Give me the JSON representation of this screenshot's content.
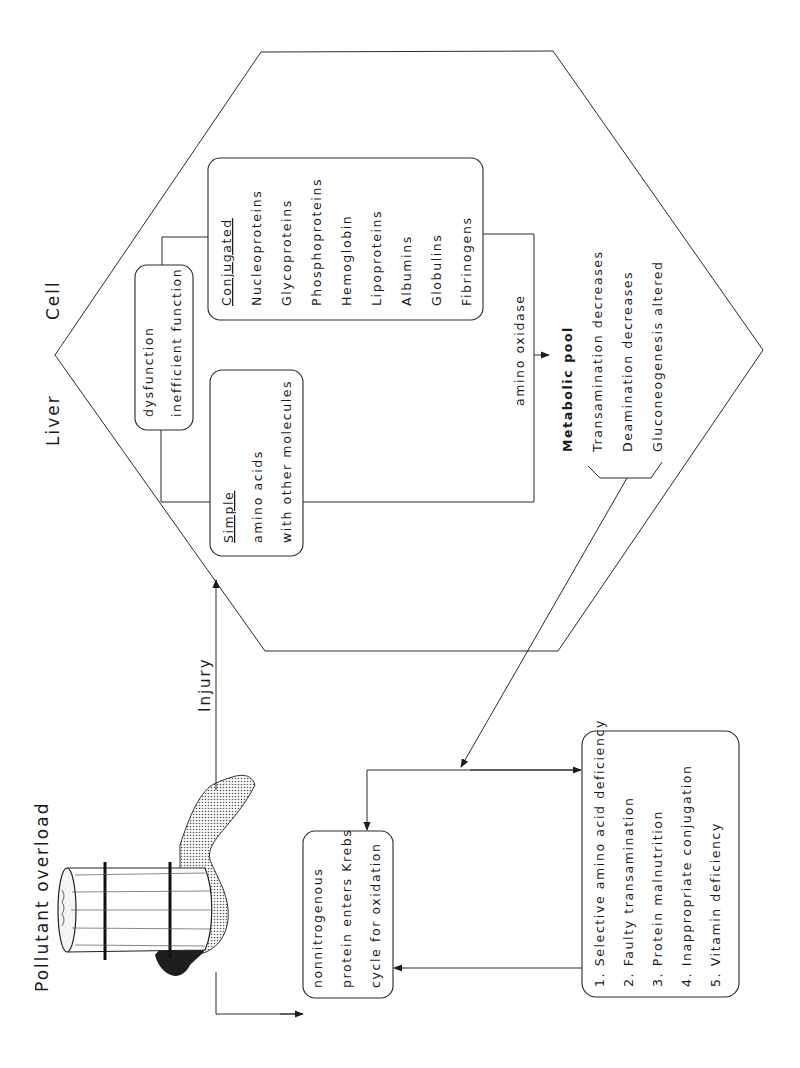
{
  "title": "Pollutant overload",
  "injury_label": "Injury",
  "liver_cell": {
    "label_word1": "Liver",
    "label_word2": "Cell",
    "dysfunction_box": {
      "lines": [
        "dysfunction",
        "inefficient function"
      ]
    },
    "simple_box": {
      "heading": "Simple",
      "lines": [
        "amino acids",
        "with other molecules"
      ]
    },
    "conjugated_box": {
      "heading": "Conjugated",
      "items": [
        "Nucleoproteins",
        "Glycoproteins",
        "Phosphoproteins",
        "Hemoglobin",
        "Lipoproteins",
        "Albumins",
        "Globulins",
        "Fibrinogens"
      ]
    },
    "enzyme_label": "amino oxidase",
    "metabolic_pool": {
      "heading": "Metabolic pool",
      "effects": [
        "Transamination decreases",
        "Deamination decreases",
        "Gluconeogenesis altered"
      ]
    }
  },
  "krebs_box": {
    "lines": [
      "nonnitrogenous",
      "protein enters Krebs",
      "cycle for oxidation"
    ]
  },
  "deficiency_list": {
    "items": [
      "1.  Selective amino acid deficiency",
      "2.  Faulty transamination",
      "3.  Protein malnutrition",
      "4.  Inappropriate conjugation",
      "5.  Vitamin deficiency"
    ]
  },
  "colors": {
    "ink": "#1a1a1a",
    "background": "#ffffff"
  }
}
